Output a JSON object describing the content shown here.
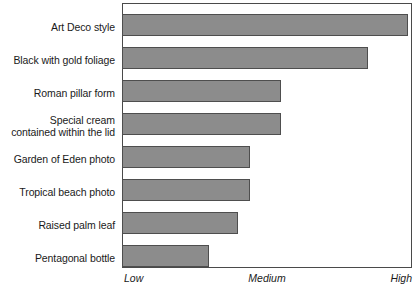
{
  "chart_data": {
    "type": "bar",
    "orientation": "horizontal",
    "title": "",
    "subtitle": "",
    "xlabel": "",
    "ylabel": "",
    "grid": false,
    "legend": null,
    "xlim": [
      0,
      1
    ],
    "x_tick_labels": [
      "Low",
      "Medium",
      "High"
    ],
    "x_tick_positions": [
      0,
      0.5,
      1
    ],
    "categories": [
      "Art Deco style",
      "Black with gold foliage",
      "Roman pillar form",
      "Special cream\ncontained within the lid",
      "Garden of Eden photo",
      "Tropical beach photo",
      "Raised palm leaf",
      "Pentagonal bottle"
    ],
    "values": [
      0.99,
      0.85,
      0.55,
      0.55,
      0.44,
      0.44,
      0.4,
      0.3
    ],
    "series": [
      {
        "name": "Rating",
        "values": [
          0.99,
          0.85,
          0.55,
          0.55,
          0.44,
          0.44,
          0.4,
          0.3
        ]
      }
    ],
    "colors": {
      "bar_fill": "#8c8c8c",
      "bar_border": "#4e4e4e",
      "frame": "#4a4a4a",
      "plot_background": "#ffffff",
      "text": "#1a1a1a"
    }
  }
}
